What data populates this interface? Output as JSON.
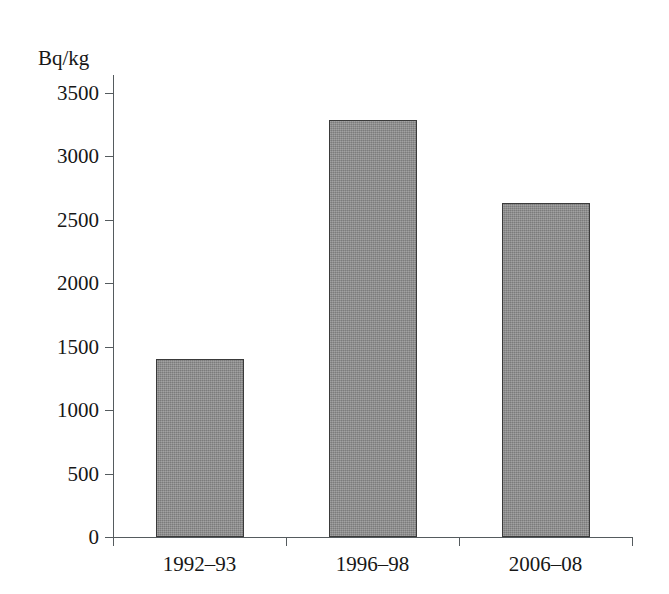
{
  "chart_data": {
    "type": "bar",
    "title": "",
    "subtitle": "",
    "xlabel": "",
    "ylabel": "Bq/kg",
    "categories": [
      "1992–93",
      "1996–98",
      "2006–08"
    ],
    "values": [
      1400,
      3290,
      2630
    ],
    "series": [
      {
        "name": "Bq/kg",
        "values": [
          1400,
          3290,
          2630
        ]
      }
    ],
    "ylim": [
      0,
      3500
    ],
    "ytick_labels": [
      "0",
      "500",
      "1000",
      "1500",
      "2000",
      "2500",
      "3000",
      "3500"
    ],
    "ytick_values": [
      0,
      500,
      1000,
      1500,
      2000,
      2500,
      3000,
      3500
    ],
    "ytick_step": 500,
    "grid": false,
    "legend": false,
    "legend_position": "none",
    "bar_fill_color": "#8a8a8a",
    "bar_edge_color": "#3a3a3a",
    "axis_color": "#555b5e",
    "background_color": "#ffffff",
    "text_color": "#171717",
    "annotations": []
  }
}
